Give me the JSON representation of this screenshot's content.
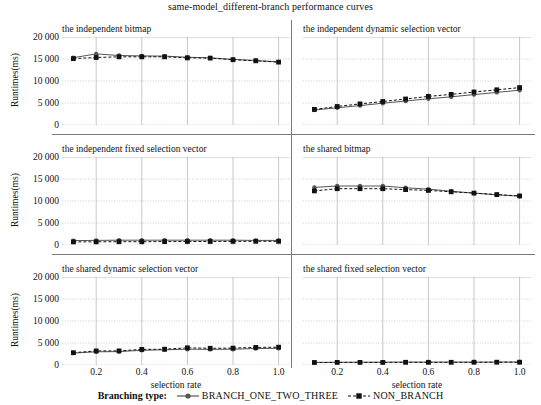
{
  "figure": {
    "title": "same-model_different-branch performance curves",
    "xlabel": "selection rate",
    "ylabel": "Runtimes(ms)"
  },
  "legend": {
    "title": "Branching type:",
    "entries": [
      {
        "label": "BRANCH_ONE_TWO_THREE",
        "color": "#555555",
        "marker": "circle",
        "style": "solid"
      },
      {
        "label": "NON_BRANCH",
        "color": "#111111",
        "marker": "square",
        "style": "dashed"
      }
    ]
  },
  "axis": {
    "ylim": [
      0,
      20000
    ],
    "yticks": [
      0,
      5000,
      10000,
      15000,
      20000
    ],
    "ytick_labels": [
      "0",
      "5 000",
      "10 000",
      "15 000",
      "20 000"
    ],
    "xlim": [
      0.05,
      1.05
    ],
    "xticks": [
      0.2,
      0.4,
      0.6,
      0.8,
      1.0
    ],
    "xtick_labels": [
      "0.2",
      "0.4",
      "0.6",
      "0.8",
      "1.0"
    ],
    "grid": true
  },
  "chart_data": {
    "type": "line",
    "title": "same-model_different-branch performance curves",
    "xlabel": "selection rate",
    "ylabel": "Runtimes(ms)",
    "xlim": [
      0.05,
      1.05
    ],
    "ylim": [
      0,
      20000
    ],
    "grid": true,
    "legend_position": "bottom",
    "x": [
      0.1,
      0.2,
      0.3,
      0.4,
      0.5,
      0.6,
      0.7,
      0.8,
      0.9,
      1.0
    ],
    "panels": [
      {
        "title": "the independent bitmap",
        "series": [
          {
            "name": "BRANCH_ONE_TWO_THREE",
            "values": [
              15300,
              16150,
              15800,
              15700,
              15650,
              15400,
              15250,
              14900,
              14650,
              14350
            ]
          },
          {
            "name": "NON_BRANCH",
            "values": [
              15100,
              15350,
              15500,
              15500,
              15500,
              15250,
              15200,
              14850,
              14600,
              14300
            ]
          }
        ]
      },
      {
        "title": "the independent dynamic selection vector",
        "series": [
          {
            "name": "BRANCH_ONE_TWO_THREE",
            "values": [
              3400,
              3900,
              4400,
              4950,
              5450,
              5950,
              6400,
              6900,
              7400,
              7900
            ]
          },
          {
            "name": "NON_BRANCH",
            "values": [
              3550,
              4200,
              4800,
              5350,
              5900,
              6500,
              6950,
              7500,
              8000,
              8500
            ]
          }
        ]
      },
      {
        "title": "the independent fixed selection vector",
        "series": [
          {
            "name": "BRANCH_ONE_TWO_THREE",
            "values": [
              1000,
              1050,
              1080,
              1100,
              1100,
              1100,
              1080,
              1080,
              1050,
              1050
            ]
          },
          {
            "name": "NON_BRANCH",
            "values": [
              700,
              720,
              740,
              760,
              780,
              800,
              800,
              820,
              830,
              850
            ]
          }
        ]
      },
      {
        "title": "the shared bitmap",
        "series": [
          {
            "name": "BRANCH_ONE_TWO_THREE",
            "values": [
              13100,
              13400,
              13400,
              13400,
              13000,
              12700,
              12200,
              11800,
              11400,
              11100
            ]
          },
          {
            "name": "NON_BRANCH",
            "values": [
              12300,
              12800,
              12800,
              12800,
              12600,
              12400,
              12100,
              11800,
              11450,
              11150
            ]
          }
        ]
      },
      {
        "title": "the shared dynamic selection vector",
        "series": [
          {
            "name": "BRANCH_ONE_TWO_THREE",
            "values": [
              2700,
              3000,
              3050,
              3350,
              3450,
              3600,
              3550,
              3600,
              3750,
              3800
            ]
          },
          {
            "name": "NON_BRANCH",
            "values": [
              2800,
              3200,
              3200,
              3550,
              3600,
              3900,
              3800,
              3850,
              4000,
              4050
            ]
          }
        ]
      },
      {
        "title": "the shared fixed selection vector",
        "series": [
          {
            "name": "BRANCH_ONE_TWO_THREE",
            "values": [
              600,
              620,
              630,
              640,
              650,
              650,
              660,
              660,
              670,
              680
            ]
          },
          {
            "name": "NON_BRANCH",
            "values": [
              560,
              580,
              590,
              600,
              610,
              615,
              620,
              625,
              630,
              640
            ]
          }
        ]
      }
    ]
  }
}
